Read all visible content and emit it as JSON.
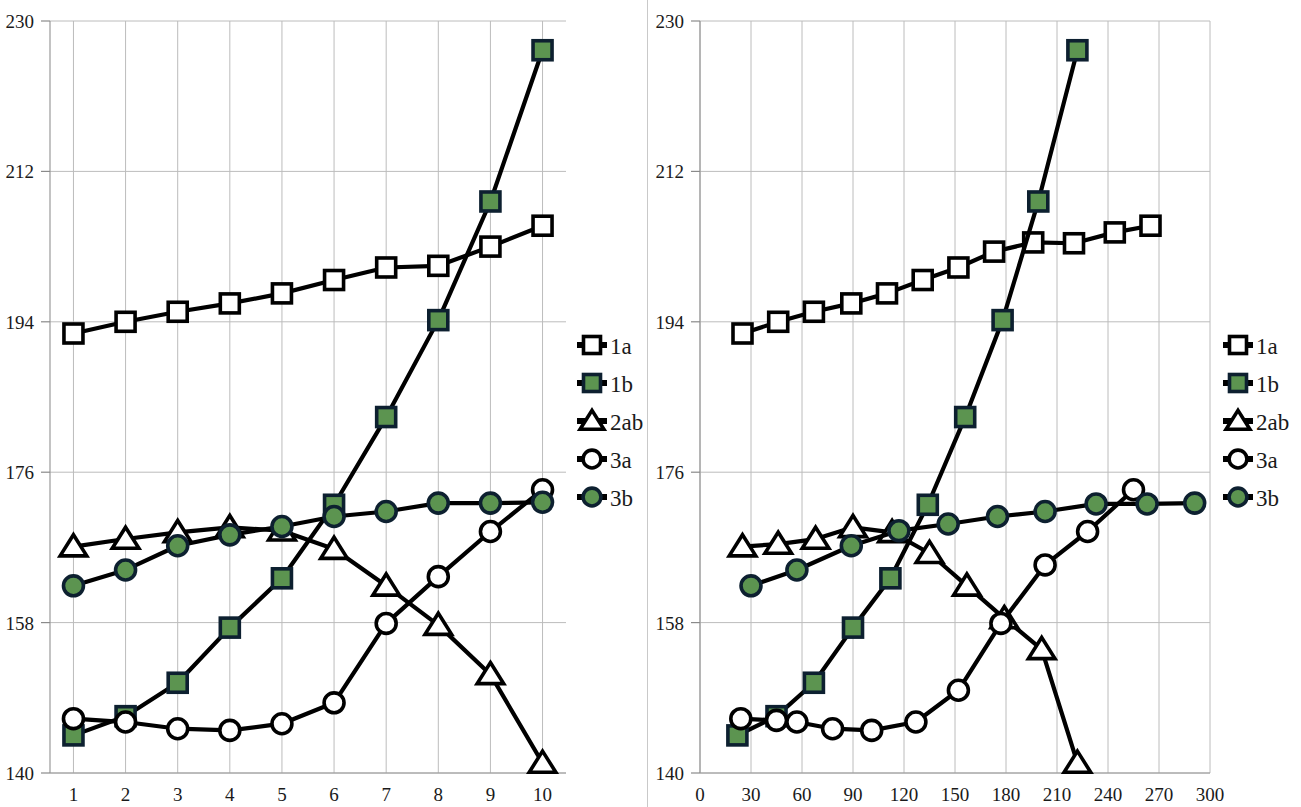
{
  "colors": {
    "green": "#5c9450",
    "marker_outline": "#000000",
    "line": "#000000",
    "grid": "#bcbcbc",
    "axis": "#9a9a9a",
    "text": "#1a1a1a",
    "background": "#ffffff"
  },
  "legend": {
    "position": "right",
    "entries": [
      {
        "label": "1a",
        "marker": "open-square",
        "icon_name": "legend-marker-open-square"
      },
      {
        "label": "1b",
        "marker": "filled-square",
        "icon_name": "legend-marker-green-square"
      },
      {
        "label": "2ab",
        "marker": "open-triangle",
        "icon_name": "legend-marker-open-triangle"
      },
      {
        "label": "3a",
        "marker": "open-circle",
        "icon_name": "legend-marker-open-circle"
      },
      {
        "label": "3b",
        "marker": "filled-circle",
        "icon_name": "legend-marker-green-circle"
      }
    ]
  },
  "chart_data": [
    {
      "id": "left",
      "type": "line",
      "title": "",
      "xlabel": "",
      "ylabel": "",
      "xlim": [
        0.55,
        10.45
      ],
      "ylim": [
        140,
        230
      ],
      "yticks": [
        140,
        158,
        176,
        194,
        212,
        230
      ],
      "xticks": [
        1,
        2,
        3,
        4,
        5,
        6,
        7,
        8,
        9,
        10
      ],
      "grid": true,
      "x": [
        1,
        2,
        3,
        4,
        5,
        6,
        7,
        8,
        9,
        10
      ],
      "series": [
        {
          "name": "1a",
          "marker": "open-square",
          "values": [
            192.6,
            194.0,
            195.2,
            196.2,
            197.4,
            199.0,
            200.5,
            200.7,
            203.0,
            205.5
          ]
        },
        {
          "name": "1b",
          "marker": "filled-square",
          "values": [
            144.5,
            146.8,
            150.8,
            157.4,
            163.3,
            172.1,
            182.6,
            194.2,
            208.4,
            226.5
          ]
        },
        {
          "name": "2ab",
          "marker": "open-triangle",
          "values": [
            167.1,
            168.0,
            168.8,
            169.4,
            169.0,
            166.8,
            162.4,
            157.7,
            151.8,
            141.2
          ]
        },
        {
          "name": "3a",
          "marker": "open-circle",
          "values": [
            146.5,
            146.1,
            145.3,
            145.1,
            145.9,
            148.4,
            157.9,
            163.5,
            168.9,
            173.9
          ]
        },
        {
          "name": "3b",
          "marker": "filled-circle",
          "values": [
            162.4,
            164.3,
            167.2,
            168.5,
            169.5,
            170.7,
            171.3,
            172.3,
            172.3,
            172.4
          ]
        }
      ]
    },
    {
      "id": "right",
      "type": "line",
      "title": "",
      "xlabel": "",
      "ylabel": "",
      "xlim": [
        0,
        300
      ],
      "ylim": [
        140,
        230
      ],
      "yticks": [
        140,
        158,
        176,
        194,
        212,
        230
      ],
      "xticks": [
        0,
        30,
        60,
        90,
        120,
        150,
        180,
        210,
        240,
        270,
        300
      ],
      "grid": true,
      "series": [
        {
          "name": "1a",
          "marker": "open-square",
          "x": [
            25,
            46,
            67,
            89,
            110,
            131,
            152,
            173,
            196,
            220,
            244,
            265
          ],
          "values": [
            192.6,
            194.0,
            195.2,
            196.2,
            197.4,
            199.0,
            200.5,
            202.4,
            203.5,
            203.4,
            204.7,
            205.5
          ]
        },
        {
          "name": "1b",
          "marker": "filled-square",
          "x": [
            22,
            45,
            67,
            90,
            112,
            134,
            156,
            178,
            199,
            222
          ],
          "values": [
            144.5,
            146.8,
            150.8,
            157.4,
            163.3,
            172.1,
            182.6,
            194.2,
            208.4,
            226.5
          ]
        },
        {
          "name": "2ab",
          "marker": "open-triangle",
          "x": [
            25,
            46,
            68,
            90,
            113,
            135,
            157,
            179,
            201,
            222
          ],
          "values": [
            167.1,
            167.4,
            168.0,
            169.4,
            168.8,
            166.3,
            162.4,
            158.5,
            154.8,
            141.2
          ]
        },
        {
          "name": "3a",
          "marker": "open-circle",
          "x": [
            24,
            45,
            57,
            78,
            101,
            127,
            152,
            177,
            203,
            228,
            255
          ],
          "values": [
            146.5,
            146.3,
            146.1,
            145.3,
            145.1,
            146.1,
            149.9,
            157.9,
            164.9,
            168.9,
            173.9
          ]
        },
        {
          "name": "3b",
          "marker": "filled-circle",
          "x": [
            30,
            57,
            89,
            117,
            146,
            175,
            203,
            233,
            263,
            291
          ],
          "values": [
            162.4,
            164.3,
            167.2,
            169.0,
            169.8,
            170.7,
            171.3,
            172.2,
            172.2,
            172.3
          ]
        }
      ]
    }
  ]
}
